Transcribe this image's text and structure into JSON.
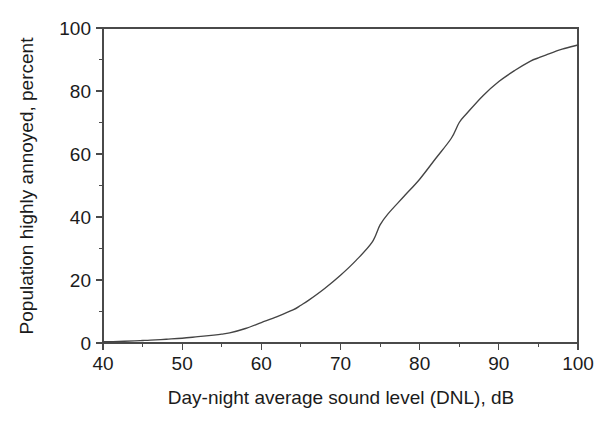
{
  "chart_data": {
    "type": "line",
    "title": "",
    "xlabel": "Day-night average sound level (DNL), dB",
    "ylabel": "Population highly annoyed, percent",
    "xlim": [
      40,
      100
    ],
    "ylim": [
      0,
      100
    ],
    "grid": false,
    "legend": null,
    "x_ticks_major": [
      40,
      50,
      60,
      70,
      80,
      90,
      100
    ],
    "x_ticks_minor": [
      45,
      55,
      65,
      75,
      85,
      95
    ],
    "y_ticks_major": [
      0,
      20,
      40,
      60,
      80,
      100
    ],
    "y_ticks_minor": [
      10,
      30,
      50,
      70,
      90
    ],
    "x_tick_labels": [
      "40",
      "50",
      "60",
      "70",
      "80",
      "90",
      "100"
    ],
    "y_tick_labels": [
      "0",
      "20",
      "40",
      "60",
      "80",
      "100"
    ],
    "series": [
      {
        "name": "Population highly annoyed",
        "color": "#444444",
        "x": [
          40,
          42,
          44,
          45,
          46,
          48,
          50,
          52,
          54,
          55,
          56,
          58,
          60,
          62,
          64,
          65,
          66,
          68,
          70,
          72,
          74,
          75,
          76,
          78,
          80,
          82,
          84,
          85,
          86,
          88,
          90,
          92,
          94,
          95,
          96,
          98,
          100
        ],
        "values": [
          0.4,
          0.5,
          0.7,
          0.8,
          0.9,
          1.2,
          1.5,
          2.0,
          2.5,
          2.8,
          3.2,
          4.6,
          6.5,
          8.4,
          10.5,
          12.0,
          13.6,
          17.3,
          21.5,
          26.3,
          32.0,
          37.5,
          41.0,
          46.5,
          52.0,
          58.5,
          65.0,
          70.0,
          73.0,
          78.5,
          83.0,
          86.5,
          89.5,
          90.5,
          91.5,
          93.3,
          94.6
        ]
      }
    ]
  },
  "figure": {
    "background_color": "#ffffff",
    "axis_color": "#4a4a4a",
    "text_color": "#1b1b1b"
  }
}
